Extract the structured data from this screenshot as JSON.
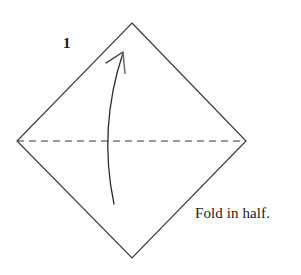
{
  "figure": {
    "kind": "origami-fold-diagram",
    "step_number": "1",
    "caption": "Fold in half.",
    "background_color": "#ffffff",
    "line_color": "#3a3a3a",
    "text_color": "#1a1a1a",
    "width": 301,
    "height": 275
  },
  "shape": {
    "name": "square-paper-diamond-orientation",
    "vertices": {
      "top": {
        "x": 132,
        "y": 23
      },
      "right": {
        "x": 246,
        "y": 141
      },
      "bottom": {
        "x": 132,
        "y": 258
      },
      "left": {
        "x": 17,
        "y": 141
      }
    },
    "stroke_width": 1.2
  },
  "fold_line": {
    "name": "horizontal-valley-fold-crease",
    "style": "dashed",
    "from": {
      "x": 17,
      "y": 141
    },
    "to": {
      "x": 246,
      "y": 141
    },
    "dash_length": 7,
    "gap_length": 5,
    "stroke_width": 1.2
  },
  "fold_arrow": {
    "name": "upward-fold-arrow",
    "direction": "bottom-to-top",
    "start": {
      "x": 114,
      "y": 204
    },
    "control": {
      "x": 98,
      "y": 128
    },
    "end": {
      "x": 123,
      "y": 53
    },
    "head": {
      "tip": {
        "x": 123,
        "y": 52
      },
      "barb_long": {
        "x": 106,
        "y": 63
      },
      "barb_short": {
        "x": 125,
        "y": 74
      }
    },
    "stroke_width": 1.3
  }
}
